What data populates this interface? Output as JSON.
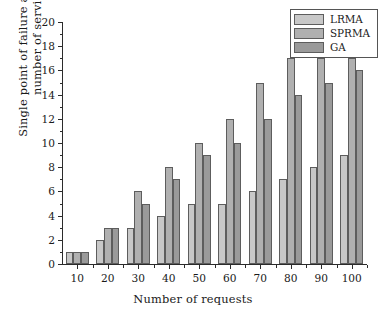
{
  "chart_data": {
    "type": "bar",
    "title": "",
    "xlabel": "Number of requests",
    "ylabel": "Single point of failure affects the number of services",
    "ylabel_line1": "Single point of failure affects the",
    "ylabel_line2": "number of services",
    "categories": [
      "10",
      "20",
      "30",
      "40",
      "50",
      "60",
      "70",
      "80",
      "90",
      "100"
    ],
    "series": [
      {
        "name": "LRMA",
        "color": "#c8c8c8",
        "values": [
          1,
          2,
          3,
          4,
          5,
          5,
          6,
          7,
          8,
          9
        ]
      },
      {
        "name": "SPRMA",
        "color": "#b0b0b0",
        "values": [
          1,
          3,
          6,
          8,
          10,
          12,
          15,
          17,
          17,
          17
        ]
      },
      {
        "name": "GA",
        "color": "#9a9a9a",
        "values": [
          1,
          3,
          5,
          7,
          9,
          10,
          12,
          14,
          15,
          16
        ]
      }
    ],
    "ylim": [
      0,
      20
    ],
    "yticks": [
      0,
      2,
      4,
      6,
      8,
      10,
      12,
      14,
      16,
      18,
      20
    ],
    "ytick_labels": [
      "0",
      "2",
      "4",
      "6",
      "8",
      "10",
      "12",
      "14",
      "16",
      "18",
      "20"
    ],
    "grid": false,
    "legend_position": "top-right",
    "legend_entries": [
      "LRMA",
      "SPRMA",
      "GA"
    ],
    "axis_spines": [
      "left",
      "bottom"
    ]
  }
}
